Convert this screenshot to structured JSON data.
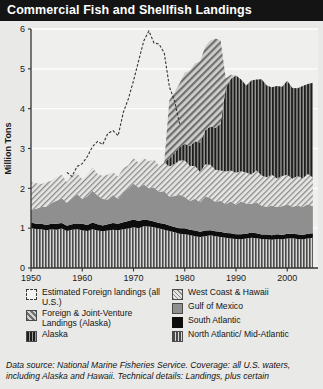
{
  "header": {
    "title": "Commercial Fish and Shellfish Landings"
  },
  "legend": {
    "left": [
      {
        "name": "estimated-foreign-landings",
        "label": "Estimated Foreign landings (all U.S.)",
        "swatch": "sw-foreign"
      },
      {
        "name": "foreign-joint-venture",
        "label": "Foreign & Joint-Venture Landings (Alaska)",
        "swatch": "sw-fjv"
      },
      {
        "name": "alaska",
        "label": "Alaska",
        "swatch": "sw-alaska"
      }
    ],
    "right": [
      {
        "name": "west-coast-hawaii",
        "label": "West Coast & Hawaii",
        "swatch": "sw-west"
      },
      {
        "name": "gulf-of-mexico",
        "label": "Gulf of Mexico",
        "swatch": "sw-gulf"
      },
      {
        "name": "south-atlantic",
        "label": "South Atlantic",
        "swatch": "sw-south"
      },
      {
        "name": "north-atlantic-mid-atlantic",
        "label": "North Atlantic/ Mid-Atlantic",
        "swatch": "sw-north"
      }
    ]
  },
  "footnote": "Data source: National Marine Fisheries Service. Coverage: all U.S. waters, including Alaska and Hawaii. Technical details: Landings, plus certain",
  "colors": {
    "title_bar": "#141414",
    "page_bg": "#e9e9e7",
    "plot_bg": "#efefed",
    "gridline": "#ffffff",
    "axis": "#333333",
    "south_atlantic": "#0d0d0d",
    "gulf_of_mexico": "#8f8f8f",
    "north_atlantic": "#4a4a4a",
    "west_coast": "#8c8c8c",
    "alaska": "#1d1d1d",
    "foreign_jv": "#6f6f6f",
    "foreign_line": "#333333"
  },
  "chart_data": {
    "type": "area",
    "title": "Commercial Fish and Shellfish Landings",
    "xlabel": "",
    "ylabel": "Million Tons",
    "xlim": [
      1950,
      2006
    ],
    "ylim": [
      0,
      6
    ],
    "yticks": [
      0,
      1,
      2,
      3,
      4,
      5,
      6
    ],
    "xticks": [
      1950,
      1960,
      1970,
      1980,
      1990,
      2000
    ],
    "grid": "horizontal",
    "legend_position": "below",
    "stack_order": [
      "North Atlantic/ Mid-Atlantic",
      "South Atlantic",
      "Gulf of Mexico",
      "West Coast & Hawaii",
      "Alaska",
      "Foreign & Joint-Venture Landings (Alaska)"
    ],
    "x": [
      1950,
      1951,
      1952,
      1953,
      1954,
      1955,
      1956,
      1957,
      1958,
      1959,
      1960,
      1961,
      1962,
      1963,
      1964,
      1965,
      1966,
      1967,
      1968,
      1969,
      1970,
      1971,
      1972,
      1973,
      1974,
      1975,
      1976,
      1977,
      1978,
      1979,
      1980,
      1981,
      1982,
      1983,
      1984,
      1985,
      1986,
      1987,
      1988,
      1989,
      1990,
      1991,
      1992,
      1993,
      1994,
      1995,
      1996,
      1997,
      1998,
      1999,
      2000,
      2001,
      2002,
      2003,
      2004,
      2005
    ],
    "series": [
      {
        "name": "North Atlantic/ Mid-Atlantic",
        "pattern": "vertical-stripe",
        "values": [
          1.0,
          0.98,
          0.97,
          0.95,
          0.97,
          0.96,
          0.99,
          0.93,
          0.96,
          0.97,
          0.95,
          0.93,
          0.97,
          0.94,
          0.92,
          0.94,
          0.96,
          0.95,
          0.97,
          0.99,
          1.02,
          1.0,
          1.05,
          1.04,
          1.02,
          0.99,
          0.96,
          0.93,
          0.9,
          0.86,
          0.85,
          0.83,
          0.8,
          0.78,
          0.8,
          0.82,
          0.8,
          0.78,
          0.76,
          0.74,
          0.73,
          0.72,
          0.74,
          0.76,
          0.75,
          0.73,
          0.72,
          0.71,
          0.73,
          0.72,
          0.74,
          0.75,
          0.73,
          0.72,
          0.74,
          0.76
        ]
      },
      {
        "name": "South Atlantic",
        "pattern": "solid-black",
        "values": [
          0.14,
          0.13,
          0.14,
          0.13,
          0.14,
          0.15,
          0.14,
          0.13,
          0.14,
          0.15,
          0.16,
          0.15,
          0.17,
          0.16,
          0.15,
          0.16,
          0.17,
          0.16,
          0.18,
          0.19,
          0.2,
          0.18,
          0.17,
          0.16,
          0.15,
          0.14,
          0.15,
          0.14,
          0.13,
          0.14,
          0.15,
          0.13,
          0.14,
          0.13,
          0.14,
          0.13,
          0.12,
          0.13,
          0.12,
          0.13,
          0.12,
          0.13,
          0.12,
          0.13,
          0.12,
          0.11,
          0.12,
          0.11,
          0.12,
          0.11,
          0.12,
          0.11,
          0.12,
          0.11,
          0.12,
          0.11
        ]
      },
      {
        "name": "Gulf of Mexico",
        "pattern": "solid-gray",
        "values": [
          0.32,
          0.38,
          0.42,
          0.45,
          0.52,
          0.58,
          0.63,
          0.58,
          0.66,
          0.74,
          0.62,
          0.72,
          0.8,
          0.72,
          0.66,
          0.62,
          0.7,
          0.62,
          0.76,
          0.82,
          0.9,
          0.84,
          0.88,
          0.8,
          0.86,
          0.78,
          0.82,
          0.72,
          0.78,
          0.84,
          0.78,
          0.72,
          0.8,
          0.74,
          0.86,
          0.8,
          0.74,
          0.78,
          0.72,
          0.8,
          0.74,
          0.82,
          0.76,
          0.72,
          0.78,
          0.72,
          0.7,
          0.74,
          0.68,
          0.72,
          0.74,
          0.68,
          0.72,
          0.7,
          0.74,
          0.68
        ]
      },
      {
        "name": "West Coast & Hawaii",
        "pattern": "diagonal-light",
        "values": [
          0.7,
          0.64,
          0.58,
          0.62,
          0.56,
          0.6,
          0.58,
          0.52,
          0.56,
          0.52,
          0.5,
          0.54,
          0.58,
          0.54,
          0.58,
          0.62,
          0.58,
          0.56,
          0.6,
          0.58,
          0.64,
          0.62,
          0.66,
          0.68,
          0.7,
          0.66,
          0.72,
          0.76,
          0.8,
          0.86,
          0.92,
          0.88,
          0.82,
          0.76,
          0.8,
          0.84,
          0.8,
          0.76,
          0.82,
          0.78,
          0.8,
          0.76,
          0.78,
          0.74,
          0.8,
          0.76,
          0.74,
          0.78,
          0.72,
          0.76,
          0.74,
          0.7,
          0.74,
          0.72,
          0.76,
          0.72
        ]
      },
      {
        "name": "Alaska",
        "pattern": "vertical-stripe-dark",
        "values": [
          0.0,
          0.0,
          0.0,
          0.0,
          0.0,
          0.0,
          0.0,
          0.0,
          0.0,
          0.0,
          0.0,
          0.0,
          0.0,
          0.0,
          0.0,
          0.0,
          0.0,
          0.0,
          0.0,
          0.0,
          0.0,
          0.0,
          0.0,
          0.0,
          0.0,
          0.0,
          0.0,
          0.2,
          0.28,
          0.34,
          0.42,
          0.5,
          0.62,
          0.74,
          0.86,
          0.96,
          1.06,
          1.18,
          2.1,
          2.3,
          2.44,
          2.3,
          2.18,
          2.36,
          2.28,
          2.42,
          2.3,
          2.2,
          2.32,
          2.24,
          2.36,
          2.28,
          2.2,
          2.32,
          2.26,
          2.38
        ]
      },
      {
        "name": "Foreign & Joint-Venture Landings (Alaska)",
        "pattern": "diagonal-coarse",
        "values": [
          0.0,
          0.0,
          0.0,
          0.0,
          0.0,
          0.0,
          0.0,
          0.0,
          0.0,
          0.0,
          0.0,
          0.0,
          0.0,
          0.0,
          0.0,
          0.0,
          0.0,
          0.0,
          0.0,
          0.0,
          0.0,
          0.0,
          0.0,
          0.0,
          0.0,
          0.0,
          0.0,
          1.46,
          1.52,
          1.6,
          1.78,
          1.9,
          1.96,
          2.04,
          2.1,
          2.16,
          2.24,
          2.08,
          0.24,
          0.1,
          0.0,
          0.0,
          0.0,
          0.0,
          0.0,
          0.0,
          0.0,
          0.0,
          0.0,
          0.0,
          0.0,
          0.0,
          0.0,
          0.0,
          0.0,
          0.0
        ]
      }
    ],
    "overlay_line": {
      "name": "Estimated Foreign landings (all U.S.)",
      "style": "dashed",
      "x": [
        1957,
        1958,
        1959,
        1960,
        1961,
        1962,
        1963,
        1964,
        1965,
        1966,
        1967,
        1968,
        1969,
        1970,
        1971,
        1972,
        1973,
        1974,
        1975,
        1976,
        1977,
        1978,
        1979
      ],
      "values": [
        2.4,
        2.3,
        2.55,
        2.62,
        2.8,
        3.05,
        3.18,
        3.1,
        3.38,
        3.45,
        3.32,
        3.9,
        4.25,
        4.7,
        5.2,
        5.7,
        5.95,
        5.65,
        5.62,
        5.4,
        4.55,
        4.2,
        3.62
      ]
    }
  }
}
